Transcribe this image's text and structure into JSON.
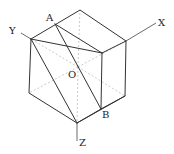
{
  "diagram": {
    "title": "",
    "colors": {
      "edge": "#333333",
      "hidden": "#bbbbbb",
      "label": "#222222"
    },
    "labels": {
      "A": "A",
      "B": "B",
      "O": "O",
      "X": "X",
      "Y": "Y",
      "Z": "Z"
    },
    "vertices": {
      "top": [
        80,
        10
      ],
      "left_top": [
        31,
        39
      ],
      "right_top": [
        126,
        41
      ],
      "front_top": [
        102,
        53
      ],
      "left_bottom": [
        29,
        93
      ],
      "right_bottom": [
        125,
        96
      ],
      "front_bottom": [
        77,
        123
      ],
      "A": [
        55,
        24
      ],
      "B": [
        101,
        109
      ],
      "O": [
        78,
        67
      ]
    }
  }
}
